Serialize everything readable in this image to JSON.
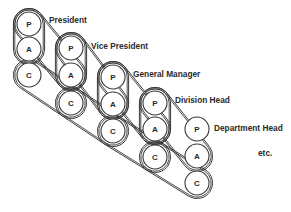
{
  "diagram": {
    "type": "belt-linked hierarchy",
    "node_letters": [
      "P",
      "A",
      "C"
    ],
    "columns": [
      {
        "label": "President",
        "x": 29,
        "y": [
          24,
          49,
          75
        ],
        "label_x": 49,
        "label_y": 20
      },
      {
        "label": "Vice President",
        "x": 71,
        "y": [
          48,
          75,
          103
        ],
        "label_x": 91,
        "label_y": 46
      },
      {
        "label": "General Manager",
        "x": 113,
        "y": [
          77,
          104,
          131
        ],
        "label_x": 133,
        "label_y": 74
      },
      {
        "label": "Division Head",
        "x": 155,
        "y": [
          103,
          129,
          157
        ],
        "label_x": 175,
        "label_y": 100
      },
      {
        "label": "Department Head",
        "x": 197,
        "y": [
          129,
          156,
          183
        ],
        "label_x": 214,
        "label_y": 128
      }
    ],
    "radius": 12,
    "trailing_text": "etc.",
    "trailing_x": 258,
    "trailing_y": 153,
    "line_color": "#3a3a3a"
  }
}
